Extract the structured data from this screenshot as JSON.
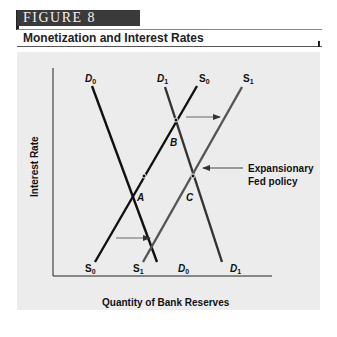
{
  "figure": {
    "tag": "FIGURE 8",
    "title": "Monetization and Interest Rates"
  },
  "axes": {
    "y_label": "Interest Rate",
    "x_label": "Quantity of Bank Reserves"
  },
  "curves": {
    "D0_top": "D0",
    "D1_top": "D1",
    "S0_top": "S0",
    "S1_top": "S1",
    "S0_bottom": "S0",
    "S1_bottom": "S1",
    "D0_bottom": "D0",
    "D1_bottom": "D1"
  },
  "points": {
    "A": "A",
    "B": "B",
    "C": "C"
  },
  "annotation": {
    "line1": "Expansionary",
    "line2": "Fed policy"
  },
  "colors": {
    "line_primary": "#111111",
    "line_shifted": "#555555",
    "panel": "#ececec",
    "tag_bg": "#3a3a3a"
  }
}
